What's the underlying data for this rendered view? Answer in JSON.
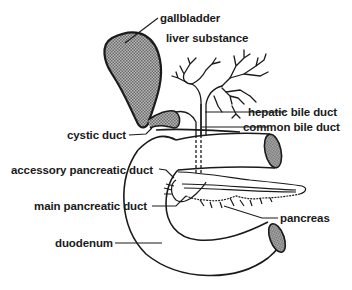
{
  "diagram": {
    "colors": {
      "stroke": "#1a1a1a",
      "stipple": "#8a8a8a",
      "background": "#ffffff"
    },
    "labels": {
      "gallbladder": "gallbladder",
      "liver_substance": "liver substance",
      "hepatic_bile_duct": "hepatic bile duct",
      "cystic_duct": "cystic duct",
      "common_bile_duct": "common bile duct",
      "accessory_pancreatic_duct": "accessory pancreatic duct",
      "main_pancreatic_duct": "main pancreatic duct",
      "pancreas": "pancreas",
      "duodenum": "duodenum"
    }
  }
}
